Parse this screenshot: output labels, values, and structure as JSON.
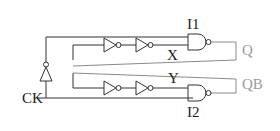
{
  "diagram": {
    "type": "circuit-schematic",
    "labels": {
      "clock": "CK",
      "gate_top": "I1",
      "gate_bottom": "I2",
      "node_top": "X",
      "node_bottom": "Y",
      "output_q": "Q",
      "output_qb": "QB"
    },
    "components": [
      {
        "id": "clock-inverter",
        "kind": "inverter",
        "orientation": "up"
      },
      {
        "id": "inv-top-1",
        "kind": "inverter",
        "orientation": "right"
      },
      {
        "id": "inv-top-2",
        "kind": "inverter",
        "orientation": "right"
      },
      {
        "id": "inv-bottom-1",
        "kind": "inverter",
        "orientation": "right"
      },
      {
        "id": "inv-bottom-2",
        "kind": "inverter",
        "orientation": "right"
      },
      {
        "id": "I1",
        "kind": "nand"
      },
      {
        "id": "I2",
        "kind": "nand"
      }
    ],
    "colors": {
      "wire": "#333333",
      "feedback_wire": "#8a8a8a",
      "output_label": "#9a9a9a",
      "label": "#1a1a1a"
    }
  }
}
